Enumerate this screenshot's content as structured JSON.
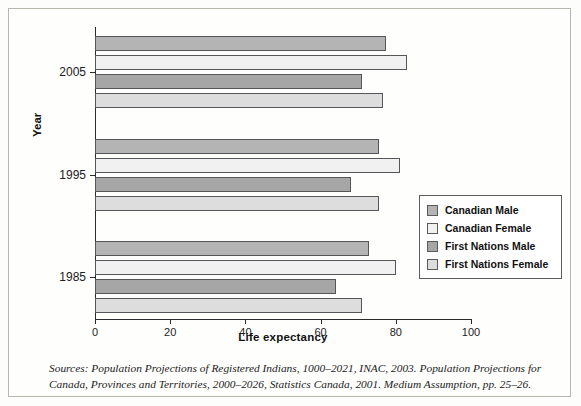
{
  "figure": {
    "background": "#fdfdfb",
    "frame_color": "#b9b6ad"
  },
  "axes": {
    "xlabel": "Life expectancy",
    "ylabel": "Year",
    "xticks": [
      "0",
      "20",
      "40",
      "60",
      "80",
      "100"
    ],
    "yticks": [
      "2005",
      "1995",
      "1985"
    ]
  },
  "legend": {
    "items": [
      {
        "label": "Canadian Male",
        "color": "#b4b4b4"
      },
      {
        "label": "Canadian Female",
        "color": "#f1f1f1"
      },
      {
        "label": "First Nations Male",
        "color": "#a6a6a6"
      },
      {
        "label": "First Nations Female",
        "color": "#dddddd"
      }
    ]
  },
  "source": {
    "line1": "Sources: Population Projections of Registered Indians, 1000–2021, INAC, 2003. Population Projections for",
    "line2": "Canada, Provinces and Territories, 2000–2026, Statistics Canada, 2001. Medium Assumption, pp. 25–26."
  },
  "chart_data": {
    "type": "bar",
    "orientation": "horizontal",
    "title": "",
    "xlabel": "Life expectancy",
    "ylabel": "Year",
    "xlim": [
      0,
      100
    ],
    "xticks": [
      0,
      20,
      40,
      60,
      80,
      100
    ],
    "grid": false,
    "legend_position": "center-right",
    "categories": [
      "2005",
      "1995",
      "1985"
    ],
    "series": [
      {
        "name": "Canadian Male",
        "color": "#b4b4b4",
        "values": [
          77.5,
          75.5,
          73.0
        ]
      },
      {
        "name": "Canadian Female",
        "color": "#f1f1f1",
        "values": [
          83.0,
          81.0,
          80.0
        ]
      },
      {
        "name": "First Nations Male",
        "color": "#a6a6a6",
        "values": [
          71.0,
          68.0,
          64.0
        ]
      },
      {
        "name": "First Nations Female",
        "color": "#dddddd",
        "values": [
          76.5,
          75.5,
          71.0
        ]
      }
    ]
  }
}
